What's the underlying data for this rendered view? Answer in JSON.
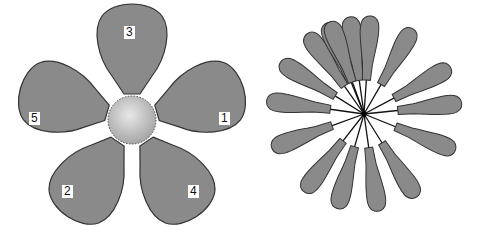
{
  "colors": {
    "petal_fill": "#8a8a8a",
    "petal_stroke": "#333333",
    "center_light": "#e6e6e6",
    "center_dark": "#a8a8a8",
    "background": "#ffffff"
  },
  "left_flower": {
    "description": "Five-petal flower with numbered petals and dotted circular center",
    "petal_labels": [
      "1",
      "2",
      "3",
      "4",
      "5"
    ]
  },
  "right_flower": {
    "description": "Sixteen-petal radial flower with petals connected to center by thin lines",
    "petal_count": 16
  }
}
